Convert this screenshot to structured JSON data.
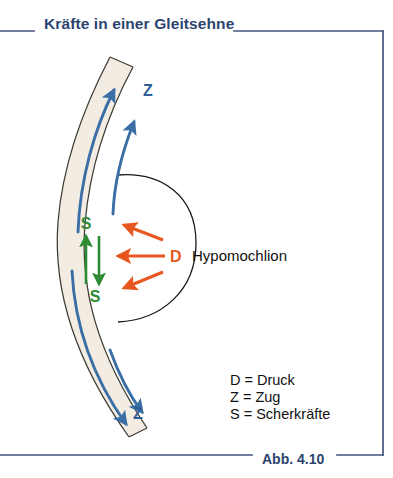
{
  "figure": {
    "title": "Kräfte in einer Gleitsehne",
    "caption": "Abb. 4.10",
    "title_color": "#2d4370",
    "frame_color": "#41557f",
    "background": "#ffffff"
  },
  "diagram": {
    "tendon": {
      "name": "Gleitsehne",
      "fill_color": "#f2ece2",
      "outline_color": "#3a3a32"
    },
    "hypomochlion_arc": {
      "name": "Hypomochlion",
      "stroke_color": "#1a1a1a"
    },
    "labels": {
      "hypomochlion": "Hypomochlion",
      "pressure_symbol": "D",
      "traction_symbol_top": "Z",
      "traction_symbol_bottom": "Z",
      "shear_symbol_top": "S",
      "shear_symbol_bottom": "S"
    },
    "colors": {
      "traction_blue": "#3b6ea5",
      "shear_green": "#2e8b33",
      "pressure_orange": "#e8571f"
    },
    "arrows": {
      "traction_count": 4,
      "shear_count": 2,
      "pressure_count": 3
    }
  },
  "legend": {
    "entries": [
      "D = Druck",
      "Z = Zug",
      "S = Scherkräfte"
    ]
  }
}
